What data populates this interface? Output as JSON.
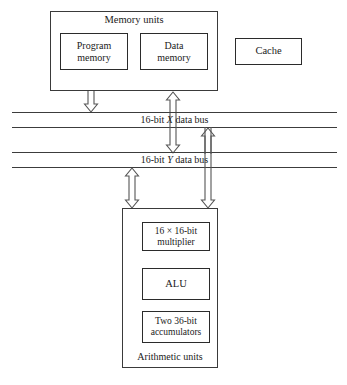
{
  "diagram": {
    "blocks": [
      {
        "id": "memory-units",
        "label": "Memory units"
      },
      {
        "id": "program-memory",
        "line1": "Program",
        "line2": "memory"
      },
      {
        "id": "data-memory",
        "line1": "Data",
        "line2": "memory"
      },
      {
        "id": "cache",
        "label": "Cache"
      },
      {
        "id": "arithmetic-units",
        "label": "Arithmetic units"
      },
      {
        "id": "multiplier",
        "line1": "16 × 16-bit",
        "line2": "multiplier"
      },
      {
        "id": "alu",
        "label": "ALU"
      },
      {
        "id": "accumulators",
        "line1": "Two 36-bit",
        "line2": "accumulators"
      }
    ],
    "buses": [
      {
        "id": "bus-x",
        "prefix": "16-bit ",
        "name": "X",
        "suffix": " data bus"
      },
      {
        "id": "bus-y",
        "prefix": "16-bit ",
        "name": "Y",
        "suffix": " data bus"
      }
    ],
    "arrows": [
      {
        "id": "program-memory-to-x-bus",
        "direction": "down"
      },
      {
        "id": "x-bus-to-data-memory",
        "direction": "up"
      },
      {
        "id": "x-bus-to-y-bus-down",
        "direction": "down"
      },
      {
        "id": "y-bus-to-x-bus-up",
        "direction": "up"
      },
      {
        "id": "arithmetic-units-to-y-bus",
        "direction": "both"
      },
      {
        "id": "y-bus-to-arithmetic-units",
        "direction": "down"
      }
    ],
    "colors": {
      "background": "#ffffff",
      "stroke": "#3a3a3a",
      "inner_stroke": "#2b2b2b",
      "arrow_stroke": "#555555",
      "text": "#1a1a1a"
    }
  }
}
